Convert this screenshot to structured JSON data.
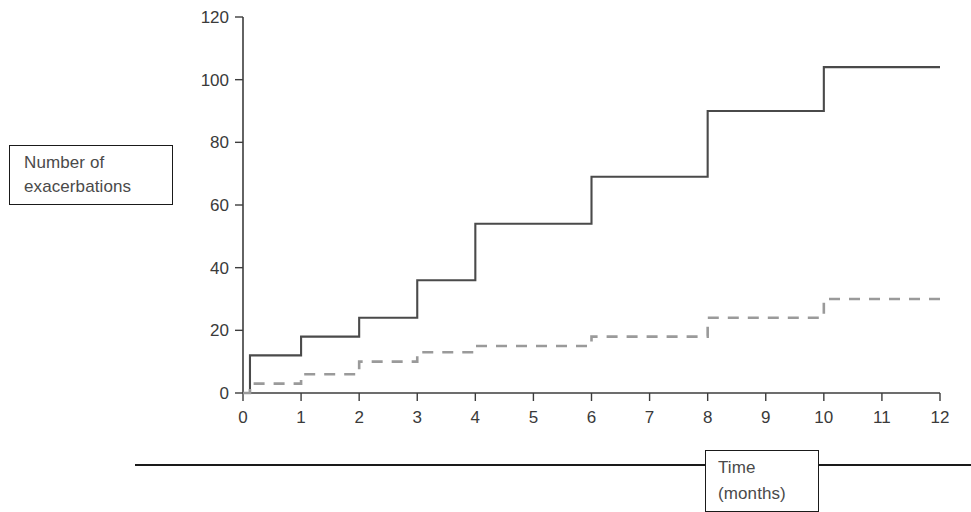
{
  "figure": {
    "y_axis_caption_lines": [
      "Number of",
      "exacerbations"
    ],
    "x_axis_caption_lines": [
      "Time",
      "(months)"
    ]
  },
  "chart_data": {
    "type": "line",
    "title": "",
    "subtitle": "",
    "xlabel": "Time (months)",
    "ylabel": "Number of exacerbations",
    "xlim": [
      0,
      12
    ],
    "ylim": [
      0,
      120
    ],
    "x_ticks": [
      0,
      1,
      2,
      3,
      4,
      5,
      6,
      7,
      8,
      9,
      10,
      11,
      12
    ],
    "x_tick_labels": [
      "0",
      "1",
      "2",
      "3",
      "4",
      "5",
      "6",
      "7",
      "8",
      "9",
      "10",
      "11",
      "12"
    ],
    "y_ticks": [
      0,
      20,
      40,
      60,
      80,
      100,
      120
    ],
    "y_tick_labels": [
      "0",
      "20",
      "40",
      "60",
      "80",
      "100",
      "120"
    ],
    "grid": false,
    "legend": false,
    "legend_position": "none",
    "step_type": "post",
    "series": [
      {
        "name": "upper-step-curve",
        "style": "solid",
        "color": "#4a4a4a",
        "x": [
          0,
          0.12,
          1,
          2,
          3,
          4,
          6,
          8,
          10,
          12
        ],
        "values": [
          0,
          12,
          18,
          24,
          36,
          54,
          69,
          90,
          104,
          104
        ]
      },
      {
        "name": "lower-step-curve",
        "style": "dashed",
        "color": "#9a9a9a",
        "x": [
          0,
          0.12,
          1,
          2,
          3,
          4,
          6,
          8,
          10,
          12
        ],
        "values": [
          0,
          3,
          6,
          10,
          13,
          15,
          18,
          24,
          30,
          30
        ]
      }
    ]
  },
  "colors": {
    "solid_series": "#4a4a4a",
    "dashed_series": "#9a9a9a",
    "axis": "#3d3d3d",
    "box_border": "#1a1a1a",
    "text": "#3a3a3a",
    "background": "#ffffff"
  }
}
